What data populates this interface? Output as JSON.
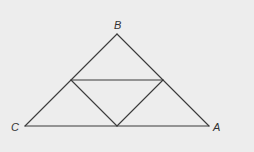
{
  "diagram": {
    "type": "triangle-midpoint-subdivision",
    "background": "#ededed",
    "line_color": "#3a3a3a",
    "vertices": {
      "B": {
        "label": "B",
        "x": 117,
        "y": 34,
        "label_x": 114,
        "label_y": 29
      },
      "C": {
        "label": "C",
        "x": 25,
        "y": 126,
        "label_x": 11,
        "label_y": 131
      },
      "A": {
        "label": "A",
        "x": 209,
        "y": 126,
        "label_x": 213,
        "label_y": 131
      }
    },
    "midpoints": {
      "BC": {
        "x": 71,
        "y": 80
      },
      "AB": {
        "x": 163,
        "y": 80
      },
      "CA": {
        "x": 117,
        "y": 126
      }
    },
    "edges": [
      {
        "from": "B",
        "to": "C"
      },
      {
        "from": "B",
        "to": "A"
      },
      {
        "from": "C",
        "to": "A"
      },
      {
        "from": "BC",
        "to": "AB"
      },
      {
        "from": "BC",
        "to": "CA"
      },
      {
        "from": "AB",
        "to": "CA"
      }
    ]
  }
}
